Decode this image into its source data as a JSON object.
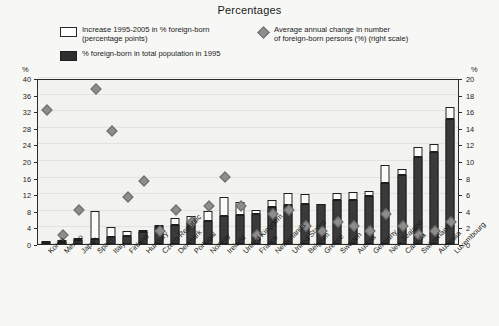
{
  "title": "Percentages",
  "legend": {
    "items": [
      {
        "icon": "open-square-swatch",
        "label": "Increase 1995-2005 in % foreign-born\n(percentage points)"
      },
      {
        "icon": "filled-square-swatch",
        "label": "% foreign-born in total population in 1995"
      },
      {
        "icon": "diamond-marker",
        "label": "Average annual change in number\nof foreign-born persons (%) (right scale)"
      }
    ]
  },
  "axes": {
    "left_unit": "%",
    "right_unit": "%",
    "left_ticks": [
      "40",
      "36",
      "32",
      "28",
      "24",
      "20",
      "16",
      "12",
      "8",
      "4",
      "0"
    ],
    "right_ticks": [
      "20",
      "18",
      "16",
      "14",
      "12",
      "10",
      "8",
      "6",
      "4",
      "2",
      "0"
    ]
  },
  "chart_data": {
    "type": "bar",
    "title": "Percentages",
    "xlabel": "",
    "ylabel": "%",
    "ylim": [
      0,
      40
    ],
    "y2lim": [
      0,
      20
    ],
    "grid": true,
    "legend_position": "top",
    "categories": [
      "Korea",
      "Mexico",
      "Japan",
      "Spain",
      "Italy",
      "Finland",
      "Hungary",
      "Czech Republic",
      "Denmark",
      "Portugal",
      "Norway",
      "Ireland",
      "United Kingdom",
      "France",
      "Netherlands",
      "United States",
      "Belgium",
      "Greece",
      "Sweden",
      "Austria",
      "Germany",
      "New Zealand",
      "Canada",
      "Switzerland",
      "Australia",
      "Luxembourg"
    ],
    "series": [
      {
        "name": "% foreign-born in total population in 1995",
        "axis": "left",
        "values": [
          0.3,
          0.4,
          1.0,
          1.3,
          1.8,
          2.0,
          2.8,
          4.2,
          4.6,
          5.2,
          5.5,
          6.8,
          6.9,
          7.3,
          8.8,
          9.3,
          9.7,
          9.7,
          10.5,
          10.6,
          11.5,
          14.8,
          16.6,
          20.9,
          22.2,
          30.2
        ]
      },
      {
        "name": "Increase 1995-2005 in % foreign-born (percentage points)",
        "axis": "left",
        "values": [
          0.2,
          0.3,
          0.5,
          6.7,
          2.2,
          1.2,
          0.5,
          0.3,
          1.6,
          1.6,
          2.4,
          4.5,
          3.3,
          0.8,
          1.8,
          3.1,
          2.4,
          0.0,
          1.8,
          2.0,
          1.3,
          4.3,
          1.6,
          2.5,
          1.8,
          2.9
        ]
      },
      {
        "name": "Average annual change in number of foreign-born persons (%) (right scale)",
        "axis": "right",
        "values": [
          16.0,
          1.0,
          4.0,
          18.5,
          13.5,
          5.5,
          7.5,
          1.5,
          4.0,
          2.5,
          4.5,
          8.0,
          4.5,
          1.0,
          3.5,
          4.0,
          2.0,
          1.5,
          2.5,
          2.0,
          1.5,
          3.5,
          2.0,
          1.0,
          1.5,
          2.5
        ]
      }
    ]
  },
  "colors": {
    "bar_dark": "#3a3a3a",
    "bar_open": "#fbfbfa",
    "marker": "#8d8d8d",
    "axis": "#2b2b2b",
    "plot_bg": "#f2f2f0",
    "page_bg": "#f7f7f5"
  }
}
